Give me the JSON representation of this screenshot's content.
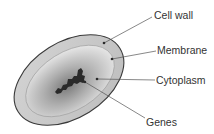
{
  "diagram": {
    "labels": [
      {
        "id": "cell-wall",
        "text": "Cell wall"
      },
      {
        "id": "membrane",
        "text": "Membrane"
      },
      {
        "id": "cytoplasm",
        "text": "Cytoplasm"
      },
      {
        "id": "genes",
        "text": "Genes"
      }
    ],
    "colors": {
      "outline": "#3a3a3a",
      "cell_wall_fill": "#c8c8c8",
      "cytoplasm_edge": "#e6e6e6",
      "cytoplasm_center": "#8a8a8a",
      "genes": "#2a2a2a",
      "leader_line": "#555555"
    }
  }
}
